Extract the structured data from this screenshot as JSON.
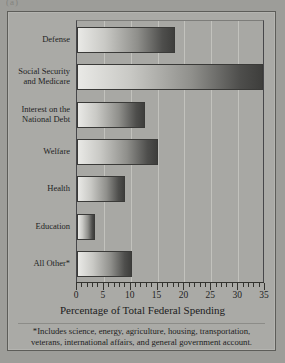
{
  "top_artifact": "(a)",
  "chart_data": {
    "type": "bar",
    "orientation": "horizontal",
    "title": "",
    "xlabel": "Percentage of Total Federal Spending",
    "ylabel": "",
    "xlim": [
      0,
      35
    ],
    "xticks": [
      0,
      5,
      10,
      15,
      20,
      25,
      30,
      35
    ],
    "xtick_labels": [
      "0",
      "5",
      "10",
      "15",
      "20",
      "25",
      "30",
      "35"
    ],
    "minor_tick_step": 1,
    "grid": "vertical",
    "legend": "none",
    "categories": [
      "Defense",
      "Social Security\nand Medicare",
      "Interest on the\nNational Debt",
      "Welfare",
      "Health",
      "Education",
      "All Other*"
    ],
    "values": [
      18.3,
      35.0,
      12.7,
      15.0,
      9.0,
      3.4,
      10.3
    ],
    "bar_fill": "gradient light-gray to dark-gray, left to right",
    "bar_colors": {
      "gradient_start": "#e9e9e6",
      "gradient_end": "#3e3e3c",
      "border": "#3a3a38"
    },
    "background_color": "#aaaaa6",
    "gridline_color": "#c2c2bd",
    "axis_color": "#33332f"
  },
  "footnote": "*Includes science, energy, agriculture, housing, transportation, veterans, international affairs, and general government account."
}
